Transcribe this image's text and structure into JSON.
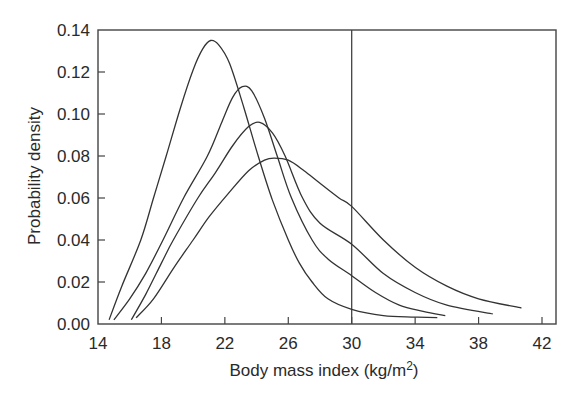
{
  "chart_data": {
    "type": "line",
    "title": "",
    "xlabel": "Body mass index (kg/m",
    "xlabel_sup": "2",
    "xlabel_close": ")",
    "ylabel": "Probability density",
    "xlim": [
      14,
      42
    ],
    "ylim": [
      0,
      0.14
    ],
    "xticks": [
      14,
      18,
      22,
      26,
      30,
      34,
      38,
      42
    ],
    "xtick_labels": [
      "14",
      "18",
      "22",
      "26",
      "30",
      "34",
      "38",
      "42"
    ],
    "yticks": [
      0,
      0.02,
      0.04,
      0.06,
      0.08,
      0.1,
      0.12,
      0.14
    ],
    "ytick_labels": [
      "0.00",
      "0.02",
      "0.04",
      "0.06",
      "0.08",
      "0.10",
      "0.12",
      "0.14"
    ],
    "grid": false,
    "legend": null,
    "reference_line": {
      "orientation": "vertical",
      "x": 30
    },
    "line_color": "#333333",
    "series": [
      {
        "name": "curve-1",
        "peak": [
          21.1,
          0.135
        ],
        "points": [
          [
            14.7,
            0.002
          ],
          [
            15.5,
            0.018
          ],
          [
            16.7,
            0.04
          ],
          [
            17.5,
            0.06
          ],
          [
            18.3,
            0.08
          ],
          [
            19.2,
            0.103
          ],
          [
            20.0,
            0.121
          ],
          [
            20.6,
            0.131
          ],
          [
            21.1,
            0.135
          ],
          [
            21.6,
            0.133
          ],
          [
            22.3,
            0.124
          ],
          [
            23.2,
            0.103
          ],
          [
            24.1,
            0.08
          ],
          [
            25.0,
            0.059
          ],
          [
            26.0,
            0.04
          ],
          [
            26.7,
            0.029
          ],
          [
            27.5,
            0.02
          ],
          [
            28.5,
            0.012
          ],
          [
            30.0,
            0.007
          ],
          [
            32.0,
            0.004
          ],
          [
            34.0,
            0.0033
          ],
          [
            35.4,
            0.003
          ]
        ]
      },
      {
        "name": "curve-2",
        "peak": [
          23.1,
          0.113
        ],
        "points": [
          [
            15.0,
            0.002
          ],
          [
            16.0,
            0.012
          ],
          [
            17.0,
            0.024
          ],
          [
            18.1,
            0.04
          ],
          [
            19.4,
            0.06
          ],
          [
            20.9,
            0.08
          ],
          [
            21.8,
            0.096
          ],
          [
            22.5,
            0.108
          ],
          [
            23.1,
            0.113
          ],
          [
            23.7,
            0.111
          ],
          [
            24.5,
            0.098
          ],
          [
            25.3,
            0.08
          ],
          [
            26.2,
            0.06
          ],
          [
            27.5,
            0.04
          ],
          [
            28.5,
            0.031
          ],
          [
            30.0,
            0.023
          ],
          [
            31.5,
            0.015
          ],
          [
            33.0,
            0.009
          ],
          [
            34.5,
            0.006
          ],
          [
            35.9,
            0.004
          ]
        ]
      },
      {
        "name": "curve-3",
        "peak": [
          24.2,
          0.096
        ],
        "points": [
          [
            16.1,
            0.002
          ],
          [
            17.0,
            0.014
          ],
          [
            18.0,
            0.029
          ],
          [
            18.75,
            0.04
          ],
          [
            20.3,
            0.06
          ],
          [
            21.4,
            0.072
          ],
          [
            22.5,
            0.085
          ],
          [
            23.5,
            0.094
          ],
          [
            24.2,
            0.096
          ],
          [
            25.0,
            0.091
          ],
          [
            25.8,
            0.08
          ],
          [
            26.9,
            0.06
          ],
          [
            28.0,
            0.048
          ],
          [
            30.0,
            0.038
          ],
          [
            32.0,
            0.024
          ],
          [
            34.0,
            0.015
          ],
          [
            36.0,
            0.009
          ],
          [
            38.9,
            0.0048
          ]
        ]
      },
      {
        "name": "curve-4",
        "peak": [
          25.1,
          0.079
        ],
        "points": [
          [
            16.4,
            0.003
          ],
          [
            17.5,
            0.012
          ],
          [
            18.8,
            0.027
          ],
          [
            20.0,
            0.04
          ],
          [
            21.0,
            0.051
          ],
          [
            22.2,
            0.062
          ],
          [
            23.5,
            0.073
          ],
          [
            24.5,
            0.078
          ],
          [
            25.1,
            0.079
          ],
          [
            26.0,
            0.078
          ],
          [
            27.0,
            0.073
          ],
          [
            28.0,
            0.067
          ],
          [
            29.2,
            0.06
          ],
          [
            30.0,
            0.056
          ],
          [
            32.0,
            0.04
          ],
          [
            34.0,
            0.027
          ],
          [
            36.0,
            0.018
          ],
          [
            38.0,
            0.012
          ],
          [
            40.7,
            0.0076
          ]
        ]
      }
    ]
  },
  "plot_area": {
    "left": 98,
    "top": 30,
    "right": 556,
    "bottom": 324
  }
}
